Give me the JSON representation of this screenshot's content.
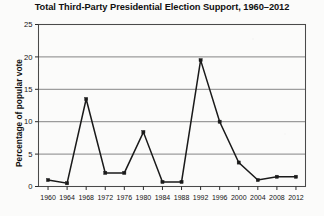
{
  "chart_data": {
    "type": "line",
    "title": "Total Third-Party Presidential Election Support, 1960–2012",
    "xlabel": "",
    "ylabel": "Percentage of popular vote",
    "x": [
      1960,
      1964,
      1968,
      1972,
      1976,
      1980,
      1984,
      1988,
      1992,
      1996,
      2000,
      2004,
      2008,
      2012
    ],
    "values": [
      1.0,
      0.5,
      13.5,
      2.1,
      2.1,
      8.4,
      0.7,
      0.7,
      19.5,
      10.0,
      3.7,
      1.0,
      1.5,
      1.5
    ],
    "series": [
      {
        "name": "Third-party popular vote share",
        "values": [
          1.0,
          0.5,
          13.5,
          2.1,
          2.1,
          8.4,
          0.7,
          0.7,
          19.5,
          10.0,
          3.7,
          1.0,
          1.5,
          1.5
        ]
      }
    ],
    "categories": [
      "1960",
      "1964",
      "1968",
      "1972",
      "1976",
      "1980",
      "1984",
      "1988",
      "1992",
      "1996",
      "2000",
      "2004",
      "2008",
      "2012"
    ],
    "xlim": [
      1958,
      2014
    ],
    "ylim": [
      0,
      25
    ],
    "yticks": [
      0,
      5,
      10,
      15,
      20,
      25
    ],
    "ytick_labels": [
      "0",
      "5",
      "10",
      "15",
      "20",
      "25"
    ],
    "xticks": [
      1960,
      1964,
      1968,
      1972,
      1976,
      1980,
      1984,
      1988,
      1992,
      1996,
      2000,
      2004,
      2008,
      2012
    ],
    "xtick_labels": [
      "1960",
      "1964",
      "1968",
      "1972",
      "1976",
      "1980",
      "1984",
      "1988",
      "1992",
      "1996",
      "2000",
      "2004",
      "2008",
      "2012"
    ],
    "grid": "horizontal",
    "legend": "none",
    "line_color": "#1a1a1a",
    "marker": "square",
    "marker_color": "#1a1a1a",
    "frame_color": "#4a4a4a",
    "background": "#fbfbfa"
  }
}
